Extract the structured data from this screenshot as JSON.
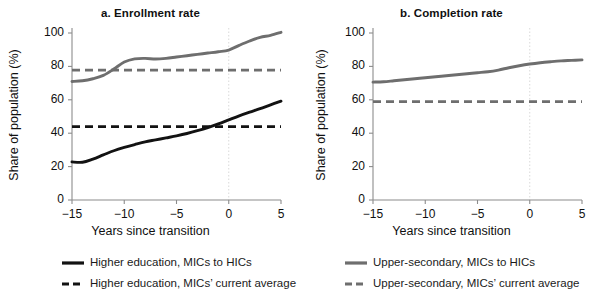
{
  "figure": {
    "background": "#ffffff",
    "axis_color": "#8c8c8c",
    "gridline_color": "#d9d9d9",
    "text_color": "#101010"
  },
  "colors": {
    "higher_education": "#121212",
    "upper_secondary": "#6e6e6e"
  },
  "panels": [
    {
      "key": "a",
      "title": "a. Enrollment rate",
      "xlabel": "Years since transition",
      "ylabel": "Share of population (%)"
    },
    {
      "key": "b",
      "title": "b. Completion rate",
      "xlabel": "Years since transition",
      "ylabel": "Share of population (%)"
    }
  ],
  "axes": {
    "y_ticks": [
      0,
      20,
      40,
      60,
      80,
      100
    ],
    "y_tick_labels": [
      "0",
      "20",
      "40",
      "60",
      "80",
      "100"
    ],
    "x_ticks": [
      -15,
      -10,
      -5,
      0,
      5
    ],
    "x_tick_labels": [
      "−15",
      "−10",
      "−5",
      "0",
      "5"
    ],
    "ylim": [
      0,
      100
    ],
    "xlim": [
      -15,
      5
    ],
    "vertical_reference_x": 0
  },
  "legend": {
    "position": "bottom",
    "columns": [
      {
        "entries": [
          {
            "label": "Higher education, MICs to HICs",
            "style": "solid",
            "color": "#121212",
            "icon": "legend-line-solid-black"
          },
          {
            "label": "Higher education, MICs’ current average",
            "style": "dashed",
            "color": "#121212",
            "icon": "legend-line-dashed-black"
          }
        ]
      },
      {
        "entries": [
          {
            "label": "Upper-secondary, MICs to HICs",
            "style": "solid",
            "color": "#6e6e6e",
            "icon": "legend-line-solid-gray"
          },
          {
            "label": "Upper-secondary, MICs’ current average",
            "style": "dashed",
            "color": "#6e6e6e",
            "icon": "legend-line-dashed-gray"
          }
        ]
      }
    ]
  },
  "chart_data": [
    {
      "type": "line",
      "panel": "a",
      "title": "a. Enrollment rate",
      "xlabel": "Years since transition",
      "ylabel": "Share of population (%)",
      "xlim": [
        -15,
        5
      ],
      "ylim": [
        0,
        100
      ],
      "grid": false,
      "x": [
        -15,
        -14,
        -13,
        -12,
        -11,
        -10,
        -9,
        -8,
        -7,
        -6,
        -5,
        -4,
        -3,
        -2,
        -1,
        0,
        1,
        2,
        3,
        4,
        5
      ],
      "series": [
        {
          "name": "Higher education, MICs to HICs",
          "style": "solid",
          "color": "#121212",
          "values": [
            22.8,
            22.6,
            24.5,
            27.0,
            29.5,
            31.5,
            33.2,
            34.8,
            36.0,
            37.2,
            38.4,
            39.8,
            41.5,
            43.4,
            45.6,
            48.0,
            50.4,
            52.6,
            54.7,
            57.0,
            59.2
          ]
        },
        {
          "name": "Upper-secondary, MICs to HICs",
          "style": "solid",
          "color": "#6e6e6e",
          "values": [
            71.0,
            71.4,
            72.6,
            74.6,
            78.4,
            82.6,
            84.5,
            84.8,
            84.4,
            84.8,
            85.6,
            86.4,
            87.2,
            88.0,
            88.8,
            89.8,
            92.6,
            95.2,
            97.4,
            98.6,
            100.4
          ]
        },
        {
          "name": "Higher education, MICs’ current average",
          "style": "dashed",
          "color": "#121212",
          "constant": 43.9
        },
        {
          "name": "Upper-secondary, MICs’ current average",
          "style": "dashed",
          "color": "#6e6e6e",
          "constant": 77.8
        }
      ]
    },
    {
      "type": "line",
      "panel": "b",
      "title": "b. Completion rate",
      "xlabel": "Years since transition",
      "ylabel": "Share of population (%)",
      "xlim": [
        -15,
        5
      ],
      "ylim": [
        0,
        100
      ],
      "grid": false,
      "x": [
        -15,
        -14,
        -13,
        -12,
        -11,
        -10,
        -9,
        -8,
        -7,
        -6,
        -5,
        -4,
        -3,
        -2,
        -1,
        0,
        1,
        2,
        3,
        4,
        5
      ],
      "series": [
        {
          "name": "Upper-secondary, MICs to HICs",
          "style": "solid",
          "color": "#6e6e6e",
          "values": [
            70.6,
            70.8,
            71.4,
            72.0,
            72.6,
            73.2,
            73.8,
            74.4,
            75.0,
            75.6,
            76.2,
            76.8,
            77.8,
            79.2,
            80.4,
            81.4,
            82.2,
            82.8,
            83.3,
            83.6,
            83.9
          ]
        },
        {
          "name": "Upper-secondary, MICs’ current average",
          "style": "dashed",
          "color": "#6e6e6e",
          "constant": 58.9
        }
      ]
    }
  ]
}
